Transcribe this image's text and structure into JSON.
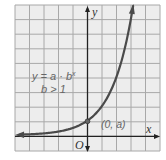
{
  "chart_data": {
    "type": "line",
    "title": "",
    "xlabel": "x",
    "ylabel": "y",
    "origin_label": "O",
    "xlim": [
      -5,
      5
    ],
    "ylim": [
      -1,
      9
    ],
    "grid": true,
    "grid_step": 1,
    "tick_labels_shown": false,
    "series": [
      {
        "name": "y = a · b^x",
        "function": "a * b^x",
        "params": {
          "a": 1,
          "b": 2
        },
        "x": [
          -5,
          -4,
          -3,
          -2,
          -1,
          0,
          1,
          2,
          3,
          3.17
        ],
        "y": [
          0.03125,
          0.0625,
          0.125,
          0.25,
          0.5,
          1,
          2,
          4,
          8,
          9
        ],
        "arrows": "both"
      }
    ],
    "annotations": [
      {
        "text_main": "y = a · b",
        "text_sup": "x",
        "line2": "b > 1",
        "position": "upper-left"
      },
      {
        "text": "(0, a)",
        "point": [
          0,
          1
        ]
      }
    ],
    "colors": {
      "background": "#ededed",
      "grid": "#a8a8a8",
      "axis": "#222222",
      "curve": "#4a4a4a",
      "annotation": "#6a6a6a"
    }
  }
}
